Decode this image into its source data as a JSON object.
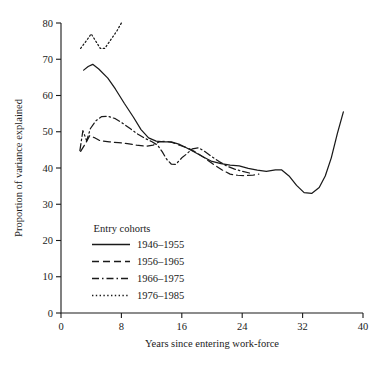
{
  "chart_data": {
    "type": "line",
    "title": "",
    "xlabel": "Years since entering work-force",
    "ylabel": "Proportion of variance explained",
    "xlim": [
      0,
      40
    ],
    "ylim": [
      0,
      80
    ],
    "xticks": [
      0,
      8,
      16,
      24,
      32,
      40
    ],
    "yticks": [
      0,
      10,
      20,
      30,
      40,
      50,
      60,
      70,
      80
    ],
    "grid": false,
    "legend_position": "inside-lower-left",
    "legend_title": "Entry cohorts",
    "series": [
      {
        "name": "1946–1955",
        "style": "solid",
        "points": [
          [
            3.0,
            67.0
          ],
          [
            3.6,
            68.0
          ],
          [
            4.2,
            68.6
          ],
          [
            5.0,
            67.3
          ],
          [
            6.2,
            64.8
          ],
          [
            7.2,
            61.8
          ],
          [
            8.4,
            57.8
          ],
          [
            9.6,
            54.0
          ],
          [
            10.6,
            50.6
          ],
          [
            11.6,
            48.3
          ],
          [
            12.6,
            47.4
          ],
          [
            13.6,
            47.2
          ],
          [
            14.6,
            47.2
          ],
          [
            15.6,
            46.6
          ],
          [
            16.6,
            45.6
          ],
          [
            17.6,
            44.5
          ],
          [
            18.8,
            43.1
          ],
          [
            20.0,
            41.8
          ],
          [
            21.2,
            41.2
          ],
          [
            22.4,
            40.8
          ],
          [
            23.6,
            40.6
          ],
          [
            24.8,
            39.9
          ],
          [
            26.0,
            39.4
          ],
          [
            27.2,
            39.1
          ],
          [
            28.4,
            39.5
          ],
          [
            29.2,
            39.5
          ],
          [
            30.2,
            37.8
          ],
          [
            31.2,
            35.2
          ],
          [
            32.2,
            33.2
          ],
          [
            33.2,
            33.0
          ],
          [
            34.2,
            34.6
          ],
          [
            35.0,
            37.8
          ],
          [
            35.8,
            42.8
          ],
          [
            36.6,
            49.5
          ],
          [
            37.4,
            55.5
          ]
        ]
      },
      {
        "name": "1956–1965",
        "style": "dashed",
        "points": [
          [
            2.6,
            44.6
          ],
          [
            3.2,
            46.6
          ],
          [
            3.8,
            48.9
          ],
          [
            4.4,
            48.4
          ],
          [
            5.2,
            47.5
          ],
          [
            6.4,
            47.2
          ],
          [
            7.6,
            47.0
          ],
          [
            8.8,
            46.7
          ],
          [
            10.0,
            46.3
          ],
          [
            11.2,
            46.0
          ],
          [
            12.2,
            46.3
          ],
          [
            13.0,
            47.2
          ],
          [
            13.8,
            47.4
          ],
          [
            14.8,
            47.0
          ],
          [
            15.8,
            46.2
          ],
          [
            16.8,
            45.5
          ],
          [
            17.8,
            44.4
          ],
          [
            19.0,
            42.8
          ],
          [
            20.2,
            41.0
          ],
          [
            21.4,
            39.4
          ],
          [
            22.4,
            38.3
          ],
          [
            23.4,
            38.0
          ],
          [
            24.4,
            37.9
          ],
          [
            25.4,
            38.0
          ],
          [
            26.2,
            38.3
          ]
        ]
      },
      {
        "name": "1966–1975",
        "style": "dashdot",
        "points": [
          [
            2.5,
            44.8
          ],
          [
            2.9,
            50.3
          ],
          [
            3.4,
            47.5
          ],
          [
            3.9,
            50.9
          ],
          [
            4.6,
            53.0
          ],
          [
            5.4,
            54.2
          ],
          [
            6.2,
            54.3
          ],
          [
            7.2,
            53.6
          ],
          [
            8.2,
            52.3
          ],
          [
            9.2,
            50.8
          ],
          [
            10.2,
            49.3
          ],
          [
            11.2,
            48.1
          ],
          [
            12.0,
            47.3
          ],
          [
            12.8,
            46.3
          ],
          [
            13.4,
            44.5
          ],
          [
            14.0,
            42.4
          ],
          [
            14.6,
            41.1
          ],
          [
            15.2,
            41.0
          ],
          [
            16.0,
            42.8
          ],
          [
            16.6,
            43.8
          ],
          [
            17.4,
            45.3
          ],
          [
            18.2,
            45.6
          ],
          [
            19.0,
            44.6
          ],
          [
            20.0,
            43.1
          ],
          [
            21.0,
            41.7
          ],
          [
            22.0,
            40.5
          ],
          [
            23.0,
            39.7
          ],
          [
            24.0,
            39.1
          ],
          [
            25.0,
            38.6
          ]
        ]
      },
      {
        "name": "1976–1985",
        "style": "dotted",
        "points": [
          [
            2.6,
            73.0
          ],
          [
            3.4,
            75.2
          ],
          [
            4.0,
            77.0
          ],
          [
            4.6,
            75.0
          ],
          [
            5.2,
            73.0
          ],
          [
            5.8,
            73.0
          ],
          [
            6.6,
            75.4
          ],
          [
            7.4,
            77.8
          ],
          [
            8.0,
            80.0
          ]
        ]
      }
    ]
  }
}
